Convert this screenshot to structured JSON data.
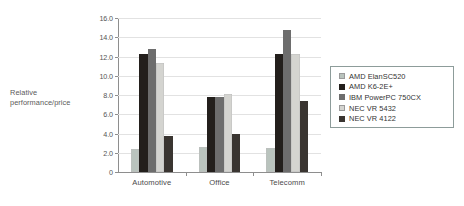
{
  "chart_data": {
    "type": "bar",
    "title": "",
    "xlabel": "",
    "ylabel": "Relative performance/price",
    "ylabel_lines": [
      "Relative",
      "performance/price"
    ],
    "categories": [
      "Automotive",
      "Office",
      "Telecomm"
    ],
    "ylim": [
      0,
      16.0
    ],
    "yticks": [
      0,
      2.0,
      4.0,
      6.0,
      8.0,
      10.0,
      12.0,
      14.0,
      16.0
    ],
    "ytick_labels": [
      "0",
      "2.0",
      "4.0",
      "6.0",
      "8.0",
      "10.0",
      "12.0",
      "14.0",
      "16.0"
    ],
    "grid": true,
    "grid_axis": "y",
    "legend_position": "right",
    "series": [
      {
        "name": "AMD ElanSC520",
        "color": "#b9c3bd",
        "values": [
          2.4,
          2.55,
          2.5
        ]
      },
      {
        "name": "AMD K6-2E+",
        "color": "#231f1c",
        "values": [
          12.25,
          7.75,
          12.3
        ]
      },
      {
        "name": "IBM PowerPC 750CX",
        "color": "#6d6d6d",
        "values": [
          12.8,
          7.75,
          14.8
        ]
      },
      {
        "name": "NEC VR 5432",
        "color": "#d4d4d0",
        "values": [
          11.3,
          8.1,
          12.25
        ]
      },
      {
        "name": "NEC VR 4122",
        "color": "#3a3531",
        "values": [
          3.75,
          3.95,
          7.35
        ]
      }
    ]
  },
  "legend": {
    "entries": [
      {
        "label": "AMD ElanSC520"
      },
      {
        "label": "AMD K6-2E+"
      },
      {
        "label": "IBM PowerPC 750CX"
      },
      {
        "label": "NEC VR 5432"
      },
      {
        "label": "NEC VR 4122"
      }
    ]
  }
}
